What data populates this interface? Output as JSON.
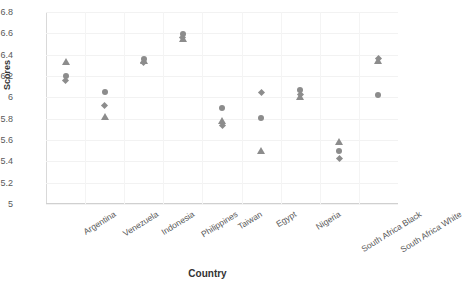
{
  "chart_data": {
    "type": "scatter",
    "title": "",
    "xlabel": "Country",
    "ylabel": "Scores",
    "categories": [
      "Argentina",
      "Venezuela",
      "Indonesia",
      "Philippines",
      "Taiwan",
      "Egypt",
      "Nigeria",
      "South Africa Black",
      "South Africa White"
    ],
    "yticks": [
      "6.8",
      "6.6",
      "6.4",
      "6.2",
      "6",
      "5.8",
      "5.6",
      "5.4",
      "5.2",
      "5"
    ],
    "ylim": [
      5.0,
      6.8
    ],
    "grid": true,
    "legend": "none",
    "marker_color": "#8c8c8c",
    "series": [
      {
        "name": "Triangle",
        "marker": "triangle",
        "values": [
          6.33,
          5.82,
          6.34,
          6.55,
          5.78,
          5.5,
          6.0,
          5.58,
          6.34
        ]
      },
      {
        "name": "Circle",
        "marker": "circle",
        "values": [
          6.2,
          6.05,
          6.36,
          6.59,
          5.9,
          5.81,
          6.07,
          5.5,
          6.02
        ]
      },
      {
        "name": "Diamond",
        "marker": "diamond",
        "values": [
          6.16,
          5.92,
          6.33,
          6.56,
          5.74,
          6.05,
          6.03,
          5.43,
          6.36
        ]
      }
    ],
    "points": [
      {
        "category": "Argentina",
        "marker": "triangle",
        "value": 6.33
      },
      {
        "category": "Argentina",
        "marker": "circle",
        "value": 6.2
      },
      {
        "category": "Argentina",
        "marker": "diamond",
        "value": 6.16
      },
      {
        "category": "Venezuela",
        "marker": "circle",
        "value": 6.05
      },
      {
        "category": "Venezuela",
        "marker": "diamond",
        "value": 5.92
      },
      {
        "category": "Venezuela",
        "marker": "triangle",
        "value": 5.82
      },
      {
        "category": "Indonesia",
        "marker": "circle",
        "value": 6.36
      },
      {
        "category": "Indonesia",
        "marker": "triangle",
        "value": 6.34
      },
      {
        "category": "Indonesia",
        "marker": "diamond",
        "value": 6.33
      },
      {
        "category": "Philippines",
        "marker": "circle",
        "value": 6.59
      },
      {
        "category": "Philippines",
        "marker": "diamond",
        "value": 6.56
      },
      {
        "category": "Philippines",
        "marker": "triangle",
        "value": 6.55
      },
      {
        "category": "Taiwan",
        "marker": "circle",
        "value": 5.9
      },
      {
        "category": "Taiwan",
        "marker": "triangle",
        "value": 5.78
      },
      {
        "category": "Taiwan",
        "marker": "diamond",
        "value": 5.74
      },
      {
        "category": "Egypt",
        "marker": "diamond",
        "value": 6.05
      },
      {
        "category": "Egypt",
        "marker": "circle",
        "value": 5.81
      },
      {
        "category": "Egypt",
        "marker": "triangle",
        "value": 5.5
      },
      {
        "category": "Nigeria",
        "marker": "circle",
        "value": 6.07
      },
      {
        "category": "Nigeria",
        "marker": "diamond",
        "value": 6.03
      },
      {
        "category": "Nigeria",
        "marker": "triangle",
        "value": 6.0
      },
      {
        "category": "South Africa Black",
        "marker": "triangle",
        "value": 5.58
      },
      {
        "category": "South Africa Black",
        "marker": "circle",
        "value": 5.5
      },
      {
        "category": "South Africa Black",
        "marker": "diamond",
        "value": 5.43
      },
      {
        "category": "South Africa White",
        "marker": "diamond",
        "value": 6.36
      },
      {
        "category": "South Africa White",
        "marker": "triangle",
        "value": 6.34
      },
      {
        "category": "South Africa White",
        "marker": "circle",
        "value": 6.02
      }
    ]
  }
}
